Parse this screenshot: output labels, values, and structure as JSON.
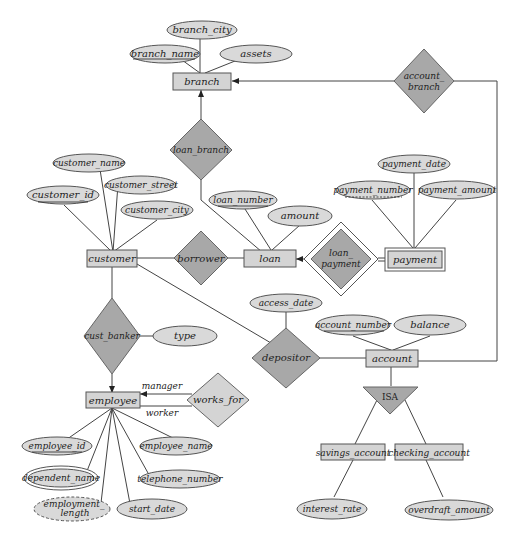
{
  "diagram": {
    "type": "entity-relationship",
    "colors": {
      "entity_fill": "#d4d4d4",
      "relationship_fill": "#a8a8a8",
      "attribute_fill": "#d9d9d9",
      "line": "#444444"
    },
    "entities": {
      "branch": "branch",
      "customer": "customer",
      "loan": "loan",
      "payment": "payment",
      "employee": "employee",
      "account": "account",
      "savings_account": "savings_account",
      "checking_account": "checking_account"
    },
    "relationships": {
      "loan_branch": "loan_branch",
      "account_branch_1": "account_",
      "account_branch_2": "branch",
      "borrower": "borrower",
      "loan_payment_1": "loan_",
      "loan_payment_2": "payment",
      "cust_banker": "cust_banker",
      "depositor": "depositor",
      "works_for": "works_for"
    },
    "isa": "ISA",
    "roles": {
      "manager": "manager",
      "worker": "worker"
    },
    "attributes": {
      "branch_city": "branch_city",
      "branch_name": "branch_name",
      "assets": "assets",
      "customer_name": "customer_name",
      "customer_id": "customer_id",
      "customer_street": "customer_street",
      "customer_city": "customer_city",
      "loan_number": "loan_number",
      "amount": "amount",
      "payment_date": "payment_date",
      "payment_number": "payment_number",
      "payment_amount": "payment_amount",
      "access_date": "access_date",
      "account_number": "account_number",
      "balance": "balance",
      "type": "type",
      "employee_id": "employee_id",
      "employee_name": "employee_name",
      "dependent_name": "dependent_name",
      "telephone_number": "telephone_number",
      "employment_length_1": "employment_",
      "employment_length_2": "length",
      "start_date": "start_date",
      "interest_rate": "interest_rate",
      "overdraft_amount": "overdraft_amount"
    }
  }
}
